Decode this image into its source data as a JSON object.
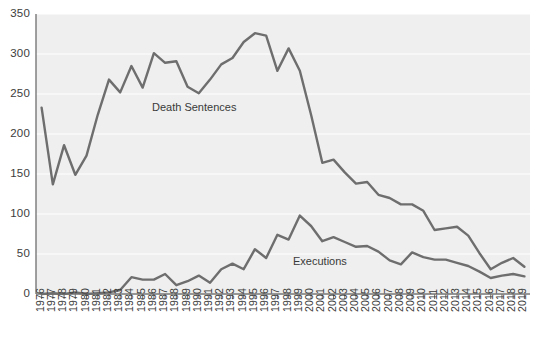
{
  "chart_data": {
    "type": "line",
    "title": "",
    "subtitle": "",
    "xlabel": "",
    "ylabel": "",
    "xlim": [
      1976,
      2019
    ],
    "ylim": [
      0,
      350
    ],
    "grid": true,
    "grid_axis": "y",
    "legend_position": "inline-annotation",
    "categories": [
      "1976",
      "1977",
      "1978",
      "1979",
      "1980",
      "1981",
      "1982",
      "1983",
      "1984",
      "1985",
      "1986",
      "1987",
      "1988",
      "1989",
      "1990",
      "1991",
      "1992",
      "1993",
      "1994",
      "1995",
      "1996",
      "1997",
      "1998",
      "1999",
      "2000",
      "2001",
      "2002",
      "2003",
      "2004",
      "2005",
      "2006",
      "2007",
      "2008",
      "2009",
      "2010",
      "2011",
      "2012",
      "2013",
      "2014",
      "2015",
      "2016",
      "2017",
      "2018",
      "2019"
    ],
    "x": [
      1976,
      1977,
      1978,
      1979,
      1980,
      1981,
      1982,
      1983,
      1984,
      1985,
      1986,
      1987,
      1988,
      1989,
      1990,
      1991,
      1992,
      1993,
      1994,
      1995,
      1996,
      1997,
      1998,
      1999,
      2000,
      2001,
      2002,
      2003,
      2004,
      2005,
      2006,
      2007,
      2008,
      2009,
      2010,
      2011,
      2012,
      2013,
      2014,
      2015,
      2016,
      2017,
      2018,
      2019
    ],
    "series": [
      {
        "name": "Death Sentences",
        "color": "#6e6e6e",
        "values": [
          233,
          137,
          186,
          149,
          173,
          224,
          268,
          252,
          285,
          258,
          301,
          289,
          291,
          259,
          251,
          268,
          287,
          295,
          315,
          326,
          323,
          279,
          307,
          279,
          224,
          164,
          168,
          152,
          138,
          140,
          124,
          120,
          112,
          112,
          104,
          80,
          82,
          84,
          73,
          51,
          31,
          39,
          45,
          34
        ]
      },
      {
        "name": "Executions",
        "color": "#6e6e6e",
        "values": [
          0,
          1,
          0,
          2,
          0,
          1,
          2,
          5,
          21,
          18,
          18,
          25,
          11,
          16,
          23,
          14,
          31,
          38,
          31,
          56,
          45,
          74,
          68,
          98,
          85,
          66,
          71,
          65,
          59,
          60,
          53,
          42,
          37,
          52,
          46,
          43,
          43,
          39,
          35,
          28,
          20,
          23,
          25,
          22
        ]
      }
    ],
    "yticks": [
      0,
      50,
      100,
      150,
      200,
      250,
      300,
      350
    ],
    "annotations": [
      {
        "name": "death-sentences-label",
        "text": "Death Sentences"
      },
      {
        "name": "executions-label",
        "text": "Executions"
      }
    ],
    "colors": {
      "plot_background": "#eeefee",
      "gridline": "#ffffff",
      "axis": "#787878",
      "line": "#6e6e6e",
      "text": "#3c3c3c"
    }
  }
}
